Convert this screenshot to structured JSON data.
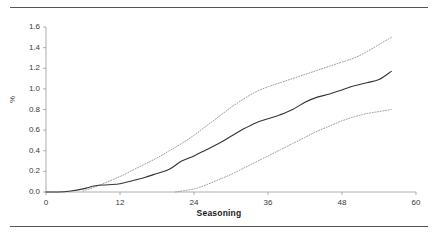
{
  "figure": {
    "background_color": "#ffffff",
    "rule_color": "#555555",
    "axis_color": "#9a9a9a",
    "series_color_solid": "#33333a",
    "series_color_dotted": "#8e8e96"
  },
  "chart_data": {
    "type": "line",
    "title": "",
    "subtitle": "",
    "xlabel": "Seasoning",
    "ylabel": "%",
    "xlim": [
      0,
      60
    ],
    "ylim": [
      0.0,
      1.6
    ],
    "xticks": [
      "0",
      "12",
      "24",
      "36",
      "48",
      "60"
    ],
    "xtick_values": [
      0,
      12,
      24,
      36,
      48,
      60
    ],
    "yticks": [
      "0.0",
      "0.2",
      "0.4",
      "0.6",
      "0.8",
      "1.0",
      "1.2",
      "1.4",
      "1.6"
    ],
    "ytick_values": [
      0.0,
      0.2,
      0.4,
      0.6,
      0.8,
      1.0,
      1.2,
      1.4,
      1.6
    ],
    "grid": false,
    "legend": null,
    "legend_position": "none",
    "annotations": [],
    "series": [
      {
        "name": "Upper confidence limit",
        "style": "dotted",
        "color": "#8e8e96",
        "x": [
          6,
          8,
          10,
          12,
          14,
          16,
          18,
          20,
          22,
          24,
          26,
          28,
          30,
          32,
          34,
          36,
          38,
          40,
          42,
          44,
          46,
          48,
          50,
          52,
          54,
          56
        ],
        "values": [
          0.01,
          0.05,
          0.1,
          0.15,
          0.21,
          0.27,
          0.33,
          0.4,
          0.47,
          0.55,
          0.64,
          0.73,
          0.82,
          0.9,
          0.97,
          1.02,
          1.06,
          1.1,
          1.14,
          1.18,
          1.22,
          1.26,
          1.3,
          1.36,
          1.43,
          1.5
        ]
      },
      {
        "name": "Estimate",
        "style": "solid",
        "color": "#33333a",
        "x": [
          0,
          2,
          4,
          6,
          8,
          10,
          12,
          14,
          16,
          18,
          20,
          22,
          24,
          26,
          28,
          30,
          32,
          34,
          36,
          38,
          40,
          42,
          44,
          46,
          48,
          50,
          52,
          54,
          56
        ],
        "values": [
          0.0,
          0.0,
          0.01,
          0.03,
          0.06,
          0.07,
          0.08,
          0.11,
          0.14,
          0.18,
          0.22,
          0.3,
          0.35,
          0.41,
          0.47,
          0.54,
          0.61,
          0.67,
          0.71,
          0.75,
          0.8,
          0.87,
          0.92,
          0.95,
          0.99,
          1.03,
          1.06,
          1.09,
          1.17
        ]
      },
      {
        "name": "Lower confidence limit",
        "style": "dotted",
        "color": "#8e8e96",
        "x": [
          21,
          24,
          26,
          28,
          30,
          32,
          34,
          36,
          38,
          40,
          42,
          44,
          46,
          48,
          50,
          52,
          54,
          56
        ],
        "values": [
          0.0,
          0.03,
          0.07,
          0.12,
          0.17,
          0.23,
          0.29,
          0.35,
          0.41,
          0.47,
          0.53,
          0.59,
          0.64,
          0.69,
          0.73,
          0.76,
          0.78,
          0.8
        ]
      }
    ]
  }
}
